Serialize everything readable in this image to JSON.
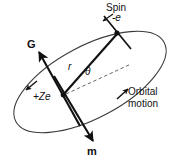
{
  "figure": {
    "background_color": "#ffffff",
    "stroke_color": "#111111",
    "text_color": "#111111"
  },
  "labels": {
    "spin": "Spin",
    "electron_charge": "-e",
    "angular_momentum": "G",
    "radius": "r",
    "angle": "θ",
    "nucleus_charge": "+Ze",
    "orbital_line1": "Orbital",
    "orbital_line2": "motion",
    "magnetic_moment": "m"
  },
  "geometry": {
    "orbit": {
      "type": "ellipse",
      "center_x": 90,
      "center_y": 82,
      "radius_x": 84,
      "radius_y": 36,
      "rotation_deg": -28
    },
    "nucleus": {
      "x": 63,
      "y": 95
    },
    "electron": {
      "x": 117,
      "y": 33
    },
    "radius_vector": {
      "from_x": 63,
      "from_y": 95,
      "to_x": 117,
      "to_y": 33
    },
    "reference_dashed_line": {
      "from_x": 66,
      "from_y": 94,
      "to_x": 131,
      "to_y": 64
    },
    "angular_momentum_arrow": {
      "from_x": 78,
      "from_y": 123,
      "to_x": 38,
      "to_y": 51
    },
    "magnetic_moment_arrow": {
      "from_x": 55,
      "from_y": 78,
      "to_x": 93,
      "to_y": 141
    },
    "spin_axis": {
      "from_x": 103,
      "from_y": 17,
      "to_x": 130,
      "to_y": 48
    },
    "spin_pointer": {
      "from_x": 112,
      "from_y": 14,
      "to_x": 102,
      "to_y": 22
    },
    "orbit_arrow_upper_right": {
      "x": 125,
      "y": 92,
      "direction_deg": -36
    },
    "orbit_arrow_lower_left": {
      "x": 28,
      "y": 88,
      "direction_deg": 140
    }
  }
}
